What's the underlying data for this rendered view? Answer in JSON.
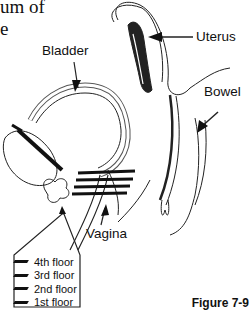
{
  "header_text": {
    "line1": "um of",
    "line2": "e"
  },
  "labels": {
    "bladder": "Bladder",
    "uterus": "Uterus",
    "bowel": "Bowel",
    "vagina": "Vagina"
  },
  "legend": {
    "items": [
      {
        "label": "4th floor"
      },
      {
        "label": "3rd floor"
      },
      {
        "label": "2nd floor"
      },
      {
        "label": "1st floor"
      }
    ]
  },
  "caption": "Figure 7-9"
}
